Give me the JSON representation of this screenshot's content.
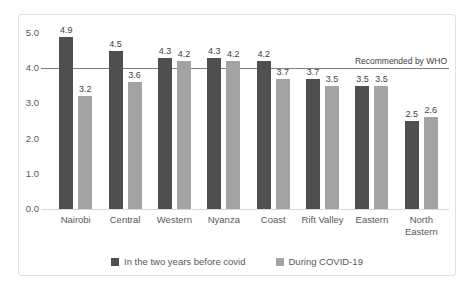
{
  "chart_data": {
    "type": "bar",
    "categories": [
      "Nairobi",
      "Central",
      "Western",
      "Nyanza",
      "Coast",
      "Rift Valley",
      "Eastern",
      "North Eastern"
    ],
    "series": [
      {
        "name": "In the two years before covid",
        "color": "#4f4f4f",
        "values": [
          4.9,
          4.5,
          4.3,
          4.3,
          4.2,
          3.7,
          3.5,
          2.5
        ]
      },
      {
        "name": "During COVID-19",
        "color": "#a3a3a3",
        "values": [
          3.2,
          3.6,
          4.2,
          4.2,
          3.7,
          3.5,
          3.5,
          2.6
        ]
      }
    ],
    "y_axis": {
      "min": 0,
      "max": 5,
      "step": 1,
      "tick_labels": [
        "0.0",
        "1.0",
        "2.0",
        "3.0",
        "4.0",
        "5.0"
      ]
    },
    "reference_line": {
      "value": 4.0,
      "label": "Recommended by WHO",
      "color": "#7f7f7f"
    },
    "title": "",
    "xlabel": "",
    "ylabel": "",
    "grid": false,
    "legend_position": "bottom"
  }
}
